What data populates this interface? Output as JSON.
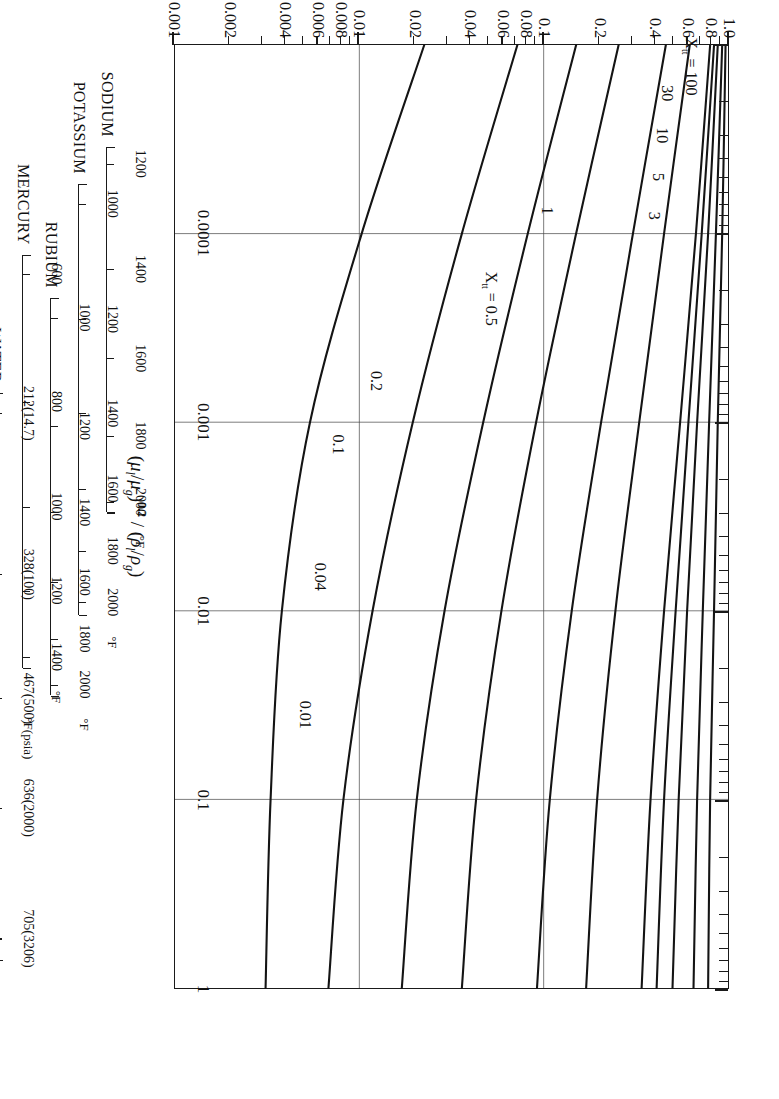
{
  "chart_data": {
    "type": "line",
    "title": "",
    "xlabel": "(μₗ/μ_g)^0.2 / (ρₗ/ρ_g)",
    "ylabel": "液相体積分率 Rₗ",
    "xscale": "log",
    "yscale": "log",
    "xlim": [
      1e-05,
      1
    ],
    "ylim": [
      0.001,
      1.0
    ],
    "grid": true,
    "legend_position": "inline-curve-labels",
    "x_tick_labels": [
      "0.0001",
      "0.001",
      "0.01",
      "0.1",
      "1"
    ],
    "x_tick_values": [
      0.0001,
      0.001,
      0.01,
      0.1,
      1
    ],
    "y_tick_labels": [
      "1.0",
      "0.8",
      "0.6",
      "0.4",
      "0.2",
      "0.1",
      "0.08",
      "0.06",
      "0.04",
      "0.02",
      "0.01",
      "0.008",
      "0.006",
      "0.004",
      "0.002",
      "0.001"
    ],
    "y_tick_values": [
      1.0,
      0.8,
      0.6,
      0.4,
      0.2,
      0.1,
      0.08,
      0.06,
      0.04,
      0.02,
      0.01,
      0.008,
      0.006,
      0.004,
      0.002,
      0.001
    ],
    "parameter_symbol": "X_tt",
    "series": [
      {
        "name": "X_tt = 100",
        "label": "Xₕₕ = 100",
        "label_text": "X",
        "param": 100,
        "points": [
          [
            1e-05,
            0.97
          ],
          [
            0.0001,
            0.93
          ],
          [
            0.001,
            0.88
          ],
          [
            0.01,
            0.84
          ],
          [
            0.1,
            0.8
          ],
          [
            1,
            0.78
          ]
        ]
      },
      {
        "name": "30",
        "label": "30",
        "param": 30,
        "points": [
          [
            1e-05,
            0.93
          ],
          [
            0.0001,
            0.86
          ],
          [
            0.001,
            0.79
          ],
          [
            0.01,
            0.73
          ],
          [
            0.1,
            0.68
          ],
          [
            1,
            0.65
          ]
        ]
      },
      {
        "name": "10",
        "label": "10",
        "param": 10,
        "points": [
          [
            1e-05,
            0.88
          ],
          [
            0.0001,
            0.78
          ],
          [
            0.001,
            0.68
          ],
          [
            0.01,
            0.6
          ],
          [
            0.1,
            0.54
          ],
          [
            1,
            0.5
          ]
        ]
      },
      {
        "name": "5",
        "label": "5",
        "param": 5,
        "points": [
          [
            1e-05,
            0.84
          ],
          [
            0.0001,
            0.72
          ],
          [
            0.001,
            0.61
          ],
          [
            0.01,
            0.52
          ],
          [
            0.1,
            0.45
          ],
          [
            1,
            0.41
          ]
        ]
      },
      {
        "name": "3",
        "label": "3",
        "param": 3,
        "points": [
          [
            1e-05,
            0.8
          ],
          [
            0.0001,
            0.67
          ],
          [
            0.001,
            0.55
          ],
          [
            0.01,
            0.45
          ],
          [
            0.1,
            0.38
          ],
          [
            1,
            0.34
          ]
        ]
      },
      {
        "name": "1",
        "label": "1",
        "param": 1,
        "points": [
          [
            1e-05,
            0.62
          ],
          [
            0.0001,
            0.45
          ],
          [
            0.001,
            0.33
          ],
          [
            0.01,
            0.245
          ],
          [
            0.1,
            0.195
          ],
          [
            1,
            0.17
          ]
        ]
      },
      {
        "name": "X_tt = 0.5",
        "label": "Xₕₕ = 0.5",
        "param": 0.5,
        "points": [
          [
            1e-05,
            0.46
          ],
          [
            0.0001,
            0.305
          ],
          [
            0.001,
            0.205
          ],
          [
            0.01,
            0.142
          ],
          [
            0.1,
            0.108
          ],
          [
            1,
            0.092
          ]
        ]
      },
      {
        "name": "0.2",
        "label": "0.2",
        "param": 0.2,
        "points": [
          [
            1e-05,
            0.255
          ],
          [
            0.0001,
            0.15
          ],
          [
            0.001,
            0.091
          ],
          [
            0.01,
            0.059
          ],
          [
            0.1,
            0.043
          ],
          [
            1,
            0.036
          ]
        ]
      },
      {
        "name": "0.1",
        "label": "0.1",
        "param": 0.1,
        "points": [
          [
            1e-05,
            0.15
          ],
          [
            0.0001,
            0.082
          ],
          [
            0.001,
            0.047
          ],
          [
            0.01,
            0.029
          ],
          [
            0.1,
            0.0205
          ],
          [
            1,
            0.017
          ]
        ]
      },
      {
        "name": "0.04",
        "label": "0.04",
        "param": 0.04,
        "points": [
          [
            1e-05,
            0.072
          ],
          [
            0.0001,
            0.036
          ],
          [
            0.001,
            0.0195
          ],
          [
            0.01,
            0.0118
          ],
          [
            0.1,
            0.0082
          ],
          [
            1,
            0.0068
          ]
        ]
      },
      {
        "name": "0.01",
        "label": "0.01",
        "param": 0.01,
        "points": [
          [
            1e-05,
            0.0225
          ],
          [
            0.0001,
            0.0103
          ],
          [
            0.001,
            0.0054
          ],
          [
            0.01,
            0.0038
          ],
          [
            0.1,
            0.0033
          ],
          [
            1,
            0.0031
          ]
        ]
      }
    ],
    "curve_label_positions": [
      {
        "label_id": "xtt100",
        "x": 1.3e-05,
        "y": 0.62
      },
      {
        "label_id": "c30",
        "x": 1.8e-05,
        "y": 0.47
      },
      {
        "label_id": "c10",
        "x": 3e-05,
        "y": 0.44
      },
      {
        "label_id": "c5",
        "x": 5e-05,
        "y": 0.42
      },
      {
        "label_id": "c3",
        "x": 8e-05,
        "y": 0.4
      },
      {
        "label_id": "c1",
        "x": 7.5e-05,
        "y": 0.105
      },
      {
        "label_id": "xtt05",
        "x": 0.00022,
        "y": 0.052
      },
      {
        "label_id": "c02",
        "x": 0.0006,
        "y": 0.0125
      },
      {
        "label_id": "c01",
        "x": 0.0013,
        "y": 0.0078
      },
      {
        "label_id": "c004",
        "x": 0.0065,
        "y": 0.0062
      },
      {
        "label_id": "c001",
        "x": 0.035,
        "y": 0.0052
      }
    ]
  },
  "axis": {
    "x_title_parts": {
      "open": "(",
      "mu_l": "μ",
      "sub_l": "l",
      "slash1": "/",
      "mu_g": "μ",
      "sub_g": "g",
      "close_pow": ")",
      "power": "0.2",
      "divider": "/",
      "open2": "(",
      "rho_l": "ρ",
      "sub_l2": "l",
      "slash2": "/",
      "rho_g": "ρ",
      "sub_g2": "g",
      "close2": ")"
    },
    "y_title": "液相体積分率",
    "y_title_symbol": "Rₗ"
  },
  "aux_scales": [
    {
      "id": "sodium",
      "name": "SODIUM",
      "unit": "°F",
      "ticks": [
        {
          "label": "1200",
          "x": 4.3e-05
        },
        {
          "label": "1400",
          "x": 0.000155
        },
        {
          "label": "1600",
          "x": 0.00046
        },
        {
          "label": "1800",
          "x": 0.00118
        },
        {
          "label": "2000",
          "x": 0.00265
        }
      ],
      "unit_at": 0.00265,
      "start_x": 3.5e-05,
      "end_x": 0.003
    },
    {
      "id": "potassium",
      "name": "POTASSIUM",
      "unit": "°F",
      "ticks": [
        {
          "label": "1000",
          "x": 7e-05
        },
        {
          "label": "1200",
          "x": 0.000285
        },
        {
          "label": "1400",
          "x": 0.0009
        },
        {
          "label": "1600",
          "x": 0.00225
        },
        {
          "label": "1800",
          "x": 0.0048
        },
        {
          "label": "2000",
          "x": 0.009
        }
      ],
      "unit_at": 0.009,
      "start_x": 5.5e-05,
      "end_x": 0.0105
    },
    {
      "id": "rubium",
      "name": "RUBIUM",
      "unit": "°F",
      "ticks": [
        {
          "label": "1000",
          "x": 0.00028
        },
        {
          "label": "1200",
          "x": 0.00105
        },
        {
          "label": "1400",
          "x": 0.003
        },
        {
          "label": "1600",
          "x": 0.007
        },
        {
          "label": "1800",
          "x": 0.014
        },
        {
          "label": "2000",
          "x": 0.0245
        }
      ],
      "unit_at": 0.0245,
      "start_x": 0.00022,
      "end_x": 0.028
    },
    {
      "id": "mercury",
      "name": "MERCURY",
      "unit": "°F",
      "ticks": [
        {
          "label": "600",
          "x": 0.000165
        },
        {
          "label": "800",
          "x": 0.00078
        },
        {
          "label": "1000",
          "x": 0.0028
        },
        {
          "label": "1200",
          "x": 0.0078
        },
        {
          "label": "1400",
          "x": 0.0175
        }
      ],
      "unit_at": 0.0175,
      "start_x": 0.00013,
      "end_x": 0.02
    },
    {
      "id": "water",
      "name": "WATER",
      "unit": "°F(psia)",
      "ticks": [
        {
          "label": "212(14.7)",
          "x": 0.0009
        },
        {
          "label": "328(100)",
          "x": 0.0064
        },
        {
          "label": "467(500)",
          "x": 0.029
        },
        {
          "label": "636(2000)",
          "x": 0.11
        },
        {
          "label": "705(3206)",
          "x": 0.54
        }
      ],
      "unit_at": 0.029,
      "start_x": 0.0007,
      "end_x": 0.7
    }
  ]
}
